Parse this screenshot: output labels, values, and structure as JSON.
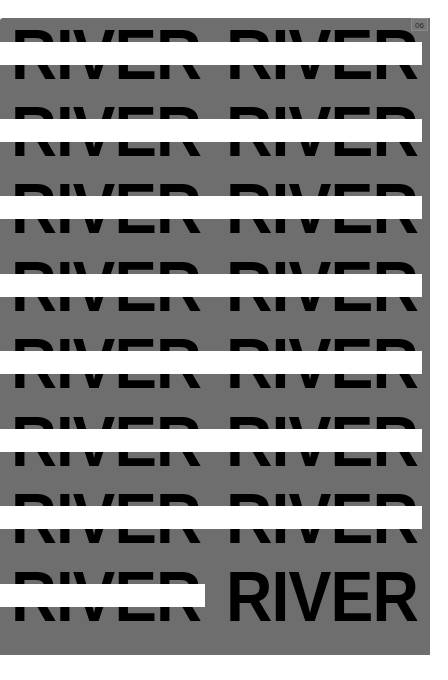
{
  "page": {
    "number_label": "06",
    "background_color": "#ffffff",
    "panel_color": "#6e6e6e",
    "text_color": "#000000",
    "bar_color": "#ffffff"
  },
  "rows": [
    {
      "word_left": "RIVER",
      "word_right": "RIVER",
      "bar_width": 422
    },
    {
      "word_left": "RIVER",
      "word_right": "RIVER",
      "bar_width": 422
    },
    {
      "word_left": "RIVER",
      "word_right": "RIVER",
      "bar_width": 422
    },
    {
      "word_left": "RIVER",
      "word_right": "RIVER",
      "bar_width": 422
    },
    {
      "word_left": "RIVER",
      "word_right": "RIVER",
      "bar_width": 422
    },
    {
      "word_left": "RIVER",
      "word_right": "RIVER",
      "bar_width": 422
    },
    {
      "word_left": "RIVER",
      "word_right": "RIVER",
      "bar_width": 422
    },
    {
      "word_left": "RIVER",
      "word_right": "RIVER",
      "bar_width": 205
    }
  ]
}
